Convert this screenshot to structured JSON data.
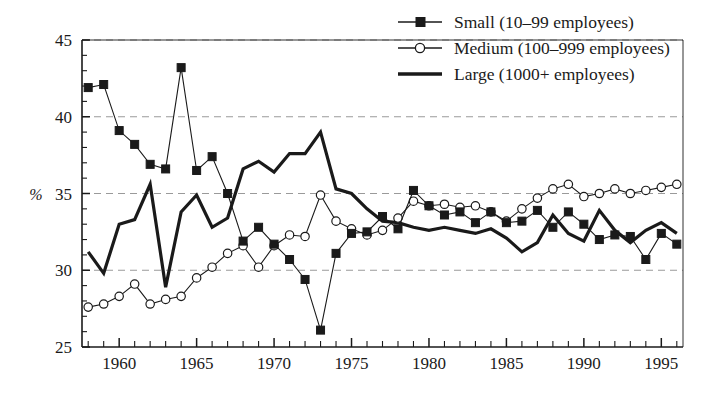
{
  "chart_data": {
    "type": "line",
    "title": "",
    "subtitle": "",
    "xlabel": "",
    "ylabel": "%",
    "xlim": [
      1957.6,
      1996.4
    ],
    "ylim": [
      25,
      45
    ],
    "yticks": [
      25,
      30,
      35,
      40,
      45
    ],
    "ytick_labels": [
      "25",
      "30",
      "35",
      "40",
      "45"
    ],
    "y_minor_step": 1,
    "xticks": [
      1960,
      1965,
      1970,
      1975,
      1980,
      1985,
      1990,
      1995
    ],
    "xtick_labels": [
      "1960",
      "1965",
      "1970",
      "1975",
      "1980",
      "1985",
      "1990",
      "1995"
    ],
    "x_minor_step": 1,
    "grid": "horizontal-dashed",
    "legend_position": "top-right",
    "colors": {
      "ink": "#1a1a1a",
      "grid": "#9a9a9a",
      "background": "#ffffff"
    },
    "x": [
      1958,
      1959,
      1960,
      1961,
      1962,
      1963,
      1964,
      1965,
      1966,
      1967,
      1968,
      1969,
      1970,
      1971,
      1972,
      1973,
      1974,
      1975,
      1976,
      1977,
      1978,
      1979,
      1980,
      1981,
      1982,
      1983,
      1984,
      1985,
      1986,
      1987,
      1988,
      1989,
      1990,
      1991,
      1992,
      1993,
      1994,
      1995,
      1996
    ],
    "series": [
      {
        "name": "Small (10–99 employees)",
        "key": "small",
        "marker": "filled-square",
        "line_width": 1.1,
        "values": [
          41.9,
          42.1,
          39.1,
          38.2,
          36.9,
          36.6,
          43.2,
          36.5,
          37.4,
          35.0,
          31.9,
          32.8,
          31.7,
          30.7,
          29.4,
          26.1,
          31.1,
          32.4,
          32.5,
          33.5,
          32.7,
          35.2,
          34.2,
          33.6,
          33.8,
          33.1,
          33.8,
          33.1,
          33.2,
          33.9,
          32.8,
          33.8,
          33.0,
          32.0,
          32.3,
          32.2,
          30.7,
          32.4,
          31.7
        ]
      },
      {
        "name": "Medium (100–999 employees)",
        "key": "medium",
        "marker": "open-circle",
        "line_width": 1.1,
        "values": [
          27.6,
          27.8,
          28.3,
          29.1,
          27.8,
          28.1,
          28.3,
          29.5,
          30.2,
          31.1,
          31.6,
          30.2,
          31.6,
          32.3,
          32.2,
          34.9,
          33.2,
          32.7,
          32.3,
          32.6,
          33.4,
          34.5,
          34.2,
          34.3,
          34.1,
          34.2,
          33.8,
          33.2,
          34.0,
          34.7,
          35.3,
          35.6,
          34.8,
          35.0,
          35.3,
          35.0,
          35.2,
          35.4,
          35.6
        ]
      },
      {
        "name": "Large (1000+  employees)",
        "key": "large",
        "marker": "none",
        "line_width": 3.2,
        "values": [
          31.2,
          29.8,
          33.0,
          33.3,
          35.6,
          28.9,
          33.8,
          34.9,
          32.8,
          33.4,
          36.6,
          37.1,
          36.4,
          37.6,
          37.6,
          39.0,
          35.3,
          35.0,
          34.0,
          33.2,
          33.1,
          32.8,
          32.6,
          32.8,
          32.6,
          32.4,
          32.7,
          32.1,
          31.2,
          31.8,
          33.6,
          32.4,
          31.9,
          33.9,
          32.6,
          31.8,
          32.6,
          33.1,
          32.4
        ]
      }
    ]
  },
  "legend": {
    "entries": [
      {
        "label": "Small (10–99 employees)",
        "marker": "filled-square"
      },
      {
        "label": "Medium (100–999 employees)",
        "marker": "open-circle"
      },
      {
        "label": "Large (1000+  employees)",
        "marker": "thick-line"
      }
    ]
  }
}
